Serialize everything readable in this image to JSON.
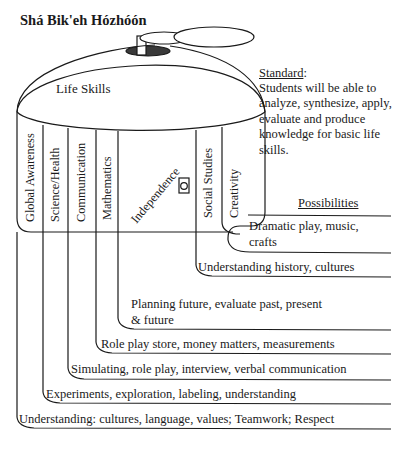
{
  "title": "Shá Bik'eh Hózhóón",
  "drum": {
    "label": "Life Skills",
    "columns": [
      {
        "label": "Global Awareness"
      },
      {
        "label": "Science/Health"
      },
      {
        "label": "Communication"
      },
      {
        "label": "Mathematics"
      },
      {
        "label": "Independence"
      },
      {
        "label": "Social Studies"
      },
      {
        "label": "Creativity"
      }
    ],
    "window_icon": "small-window-circle-icon"
  },
  "standard": {
    "heading": "Standard",
    "heading_suffix": ":",
    "body": "Students will be able to analyze, synthesize, apply, evaluate and produce knowledge for basic life skills."
  },
  "possibilities": {
    "heading": "Possibilities",
    "rows": [
      {
        "column": "Creativity",
        "text": "Dramatic play, music, crafts"
      },
      {
        "column": "Social Studies",
        "text": "Understanding history, cultures"
      },
      {
        "column": "Independence",
        "text": "Planning future, evaluate past, present & future"
      },
      {
        "column": "Mathematics",
        "text": "Role play store, money matters, measurements"
      },
      {
        "column": "Communication",
        "text": "Simulating, role play, interview, verbal communication"
      },
      {
        "column": "Science/Health",
        "text": "Experiments, exploration, labeling, understanding"
      },
      {
        "column": "Global Awareness",
        "text": "Understanding: cultures, language, values; Teamwork; Respect"
      }
    ]
  },
  "colors": {
    "ink": "#1a1a1a",
    "background": "#ffffff",
    "lid_shade": "#3a3a3a"
  }
}
